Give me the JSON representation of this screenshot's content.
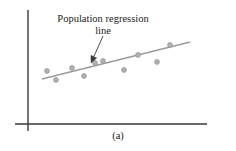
{
  "figure": {
    "panel_label": "(a)",
    "annotation": {
      "line1": "Population regression",
      "line2": "line"
    },
    "colors": {
      "axis": "#3a3a3a",
      "regression_line": "#9a9a9a",
      "point_fill": "#b3b3b3",
      "point_stroke": "#8c8c8c",
      "arrow": "#3a3a3a",
      "text": "#1b1b1b",
      "background": "#ffffff"
    }
  },
  "chart_data": {
    "type": "scatter",
    "title": "",
    "subtitle": "",
    "xlabel": "",
    "ylabel": "",
    "panel": "(a)",
    "grid": false,
    "legend": null,
    "axes": {
      "x_axis": {
        "x1": 15,
        "y1": 124,
        "x2": 207,
        "y2": 124
      },
      "y_axis": {
        "x1": 28,
        "y1": 10,
        "x2": 28,
        "y2": 131
      },
      "ticks": [],
      "xlim": [
        15,
        207
      ],
      "ylim": [
        10,
        131
      ]
    },
    "annotations": [
      {
        "text": "Population regression line",
        "arrow_from": [
          103,
          36
        ],
        "arrow_to": [
          91,
          63
        ]
      }
    ],
    "series": [
      {
        "name": "observations",
        "type": "scatter",
        "points": [
          [
            47,
            71
          ],
          [
            56,
            80
          ],
          [
            72,
            68
          ],
          [
            84,
            76
          ],
          [
            95,
            63
          ],
          [
            103,
            61
          ],
          [
            124,
            70
          ],
          [
            138,
            55
          ],
          [
            157,
            62
          ],
          [
            170,
            45
          ]
        ]
      },
      {
        "name": "population regression line",
        "type": "line",
        "endpoints": [
          [
            42,
            79
          ],
          [
            190,
            42
          ]
        ]
      }
    ]
  }
}
